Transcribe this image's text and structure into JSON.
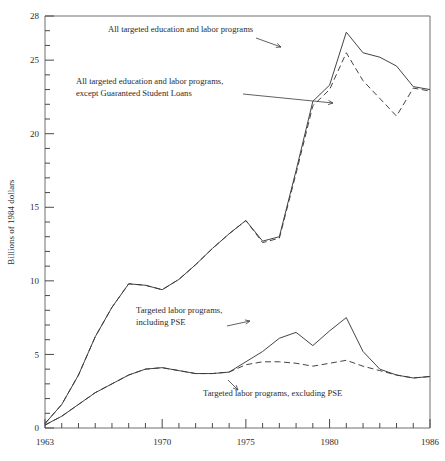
{
  "chart_data": {
    "type": "line",
    "title": "",
    "xlabel": "",
    "ylabel": "Billions of 1984 dollars",
    "xlim": [
      1963,
      1986
    ],
    "ylim": [
      0,
      28
    ],
    "grid": false,
    "legend_position": "inline-annotations",
    "y_ticks_labeled": [
      0,
      5,
      10,
      15,
      20,
      25,
      28
    ],
    "y_tick_labels": [
      "0",
      "5",
      "10",
      "15",
      "20",
      "25",
      "28"
    ],
    "y_minor_tick_interval": 1,
    "x_ticks_labeled": [
      1963,
      1970,
      1975,
      1980,
      1986
    ],
    "x_tick_labels": [
      "1963",
      "1970",
      "1975",
      "1980",
      "1986"
    ],
    "x_minor_tick_interval": 1,
    "x": [
      1963,
      1964,
      1965,
      1966,
      1967,
      1968,
      1969,
      1970,
      1971,
      1972,
      1973,
      1974,
      1975,
      1976,
      1977,
      1978,
      1979,
      1980,
      1981,
      1982,
      1983,
      1984,
      1985,
      1986
    ],
    "series": [
      {
        "name": "All targeted education and labor programs",
        "style": "solid",
        "color": "#3a3a3a",
        "values": [
          0.3,
          1.6,
          3.6,
          6.2,
          8.2,
          9.8,
          9.7,
          9.4,
          10.1,
          11.1,
          12.2,
          13.2,
          14.1,
          12.7,
          13.0,
          17.5,
          22.2,
          23.3,
          26.9,
          25.5,
          25.2,
          24.6,
          23.2,
          23.0
        ]
      },
      {
        "name": "All targeted education and labor programs, except Guaranteed Student Loans",
        "style": "dashed",
        "color": "#3a3a3a",
        "values": [
          0.3,
          1.6,
          3.6,
          6.2,
          8.2,
          9.8,
          9.7,
          9.4,
          10.1,
          11.1,
          12.2,
          13.2,
          14.1,
          12.6,
          12.9,
          17.3,
          21.9,
          23.0,
          25.5,
          23.6,
          22.4,
          21.2,
          23.1,
          22.9
        ]
      },
      {
        "name": "Targeted labor programs, including PSE",
        "style": "solid",
        "color": "#3a3a3a",
        "values": [
          0.2,
          0.8,
          1.6,
          2.4,
          3.0,
          3.6,
          4.0,
          4.1,
          3.9,
          3.7,
          3.7,
          3.8,
          4.5,
          5.2,
          6.1,
          6.5,
          5.6,
          6.6,
          7.5,
          5.2,
          4.0,
          3.6,
          3.4,
          3.5
        ]
      },
      {
        "name": "Targeted labor programs, excluding PSE",
        "style": "dashed",
        "color": "#3a3a3a",
        "values": [
          0.2,
          0.8,
          1.6,
          2.4,
          3.0,
          3.6,
          4.0,
          4.1,
          3.9,
          3.7,
          3.7,
          3.8,
          4.3,
          4.5,
          4.5,
          4.4,
          4.2,
          4.4,
          4.6,
          4.2,
          3.9,
          3.6,
          3.4,
          3.5
        ]
      }
    ],
    "annotations": [
      {
        "id": "annot-all-programs",
        "lines": [
          "All targeted education and labor programs"
        ],
        "text_x": 108,
        "text_y": 32,
        "arrow": {
          "x1": 256,
          "y1": 38,
          "x2": 281,
          "y2": 47
        }
      },
      {
        "id": "annot-all-programs-except-gsl",
        "lines": [
          "All targeted education and labor programs,",
          "except Guaranteed Student Loans"
        ],
        "text_x": 76,
        "text_y": 84,
        "arrow": {
          "x1": 243,
          "y1": 94,
          "x2": 333,
          "y2": 103
        }
      },
      {
        "id": "annot-labor-including-pse",
        "lines": [
          "Targeted labor programs,",
          "including PSE"
        ],
        "text_x": 136,
        "text_y": 313,
        "arrow": {
          "x1": 227,
          "y1": 326,
          "x2": 250,
          "y2": 321
        }
      },
      {
        "id": "annot-labor-excluding-pse",
        "lines": [
          "Targeted labor programs, excluding PSE"
        ],
        "text_x": 203,
        "text_y": 396,
        "arrow": {
          "x1": 228,
          "y1": 380,
          "x2": 238,
          "y2": 390
        }
      }
    ]
  },
  "plot_geometry": {
    "left": 45,
    "right": 430,
    "top": 16,
    "bottom": 428
  }
}
